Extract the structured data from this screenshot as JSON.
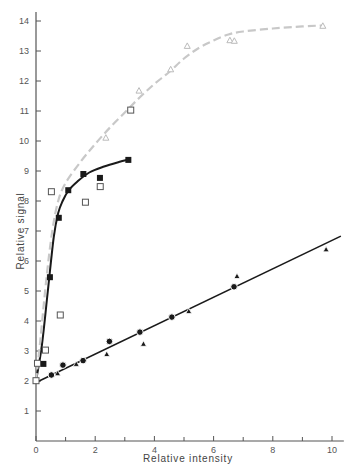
{
  "chart_data": {
    "type": "scatter",
    "title": "",
    "xlabel": "Relative intensity",
    "ylabel": "Relative signal",
    "xlim": [
      0,
      10.4
    ],
    "ylim": [
      0,
      14.3
    ],
    "x_ticks": [
      0,
      2,
      4,
      6,
      8,
      10
    ],
    "x_minor_ticks": [
      1,
      3,
      5,
      7,
      9
    ],
    "y_ticks": [
      1,
      2,
      3,
      4,
      5,
      6,
      7,
      8,
      9,
      10,
      11,
      12,
      13,
      14
    ],
    "grid": false,
    "legend": null,
    "colors": {
      "axis": "#555555",
      "dark_series": "#1a1a1a",
      "light_curve": "#c8c8c8",
      "open_marker": "#555555",
      "open_triangle": "#bbbbbb"
    },
    "series": [
      {
        "name": "filled squares",
        "marker": "filled-square",
        "points": [
          [
            0.25,
            2.57
          ],
          [
            0.47,
            5.46
          ],
          [
            0.77,
            7.44
          ],
          [
            1.09,
            8.36
          ],
          [
            1.6,
            8.9
          ],
          [
            2.16,
            8.77
          ],
          [
            3.12,
            9.37
          ]
        ]
      },
      {
        "name": "open squares",
        "marker": "open-square",
        "points": [
          [
            0.0,
            2.01
          ],
          [
            0.05,
            2.59
          ],
          [
            0.32,
            3.03
          ],
          [
            0.82,
            4.2
          ],
          [
            0.52,
            8.31
          ],
          [
            1.67,
            7.96
          ],
          [
            2.17,
            8.48
          ],
          [
            3.2,
            11.03
          ]
        ]
      },
      {
        "name": "open triangles",
        "marker": "open-triangle",
        "points": [
          [
            2.36,
            10.11
          ],
          [
            3.48,
            11.68
          ],
          [
            4.55,
            12.39
          ],
          [
            5.11,
            13.17
          ],
          [
            6.55,
            13.36
          ],
          [
            6.7,
            13.34
          ],
          [
            9.69,
            13.84
          ]
        ]
      },
      {
        "name": "filled circles",
        "marker": "filled-circle",
        "points": [
          [
            0.52,
            2.2
          ],
          [
            0.91,
            2.53
          ],
          [
            1.59,
            2.68
          ],
          [
            2.48,
            3.32
          ],
          [
            3.51,
            3.63
          ],
          [
            4.59,
            4.13
          ],
          [
            6.69,
            5.14
          ]
        ]
      },
      {
        "name": "filled triangles",
        "marker": "filled-triangle",
        "points": [
          [
            0.73,
            2.26
          ],
          [
            1.36,
            2.57
          ],
          [
            2.39,
            2.9
          ],
          [
            3.63,
            3.24
          ],
          [
            5.16,
            4.33
          ],
          [
            6.79,
            5.5
          ],
          [
            9.8,
            6.39
          ]
        ]
      }
    ],
    "fit_curves": [
      {
        "name": "solid saturating curve (filled squares)",
        "style": "solid-black",
        "points": [
          [
            0.0,
            2.0
          ],
          [
            0.2,
            3.2
          ],
          [
            0.4,
            5.0
          ],
          [
            0.6,
            6.8
          ],
          [
            0.75,
            7.6
          ],
          [
            0.9,
            8.0
          ],
          [
            1.1,
            8.35
          ],
          [
            1.4,
            8.65
          ],
          [
            1.8,
            8.95
          ],
          [
            2.3,
            9.15
          ],
          [
            2.8,
            9.3
          ],
          [
            3.12,
            9.38
          ]
        ]
      },
      {
        "name": "dashed saturating curve (open symbols)",
        "style": "dashed-grey",
        "points": [
          [
            0.0,
            2.0
          ],
          [
            0.15,
            3.4
          ],
          [
            0.35,
            5.4
          ],
          [
            0.55,
            7.0
          ],
          [
            0.75,
            8.0
          ],
          [
            1.0,
            8.6
          ],
          [
            1.5,
            9.3
          ],
          [
            2.0,
            9.9
          ],
          [
            2.5,
            10.45
          ],
          [
            3.0,
            10.95
          ],
          [
            3.5,
            11.45
          ],
          [
            4.0,
            11.9
          ],
          [
            4.5,
            12.3
          ],
          [
            5.0,
            12.75
          ],
          [
            5.5,
            13.1
          ],
          [
            6.0,
            13.35
          ],
          [
            6.5,
            13.55
          ],
          [
            7.0,
            13.65
          ],
          [
            8.0,
            13.75
          ],
          [
            9.0,
            13.82
          ],
          [
            9.7,
            13.85
          ]
        ]
      },
      {
        "name": "linear fit (circles and filled triangles)",
        "style": "solid-black-with-gaps",
        "points": [
          [
            0.0,
            1.95
          ],
          [
            10.3,
            6.83
          ]
        ]
      }
    ]
  }
}
